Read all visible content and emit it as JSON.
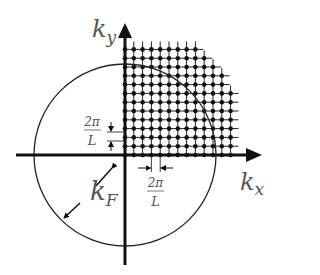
{
  "diagram": {
    "labels": {
      "ky_main": "k",
      "ky_sub": "y",
      "kx_main": "k",
      "kx_sub": "x",
      "kF_main": "k",
      "kF_sub": "F",
      "spacing_num_vertical": "2π",
      "spacing_den_vertical": "L",
      "spacing_num_horizontal": "2π",
      "spacing_den_horizontal": "L"
    },
    "geometry": {
      "origin": [
        125,
        155
      ],
      "circle_radius": 91,
      "grid_spacing": 8.8,
      "column_heights": [
        12,
        12,
        12,
        12,
        12,
        12,
        12,
        12,
        12,
        11,
        10,
        9,
        7
      ]
    },
    "colors": {
      "axis": "#111111",
      "grid": "#222222",
      "label": "#555555"
    }
  }
}
